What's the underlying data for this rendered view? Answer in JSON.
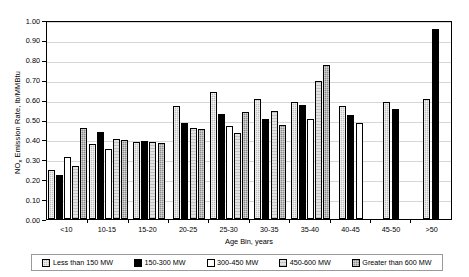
{
  "chart_data": {
    "type": "bar",
    "title": "",
    "xlabel": "Age Bin, years",
    "ylabel": "NOx Emission Rate, lb/MMBtu",
    "ylim": [
      0.0,
      1.0
    ],
    "ytick_step": 0.1,
    "grid": true,
    "legend_position": "bottom",
    "categories": [
      "<10",
      "10-15",
      "15-20",
      "20-25",
      "25-30",
      "30-35",
      "35-40",
      "40-45",
      "45-50",
      ">50"
    ],
    "ytick_labels": [
      "0.00",
      "0.10",
      "0.20",
      "0.30",
      "0.40",
      "0.50",
      "0.60",
      "0.70",
      "0.80",
      "0.90",
      "1.00"
    ],
    "series": [
      {
        "name": "Less than 150 MW",
        "color": "#bfbfbf",
        "values": [
          0.245,
          0.375,
          0.385,
          0.567,
          0.637,
          0.603,
          0.588,
          0.568,
          0.587,
          0.605
        ]
      },
      {
        "name": "150-300 MW",
        "color": "#000000",
        "values": [
          0.222,
          0.438,
          0.392,
          0.485,
          0.528,
          0.502,
          0.575,
          0.522,
          0.555,
          0.955
        ]
      },
      {
        "name": "300-450 MW",
        "color": "#ffffff",
        "values": [
          0.313,
          0.352,
          null,
          null,
          0.467,
          null,
          0.502,
          0.483,
          null,
          null
        ]
      },
      {
        "name": "450-600 MW",
        "color": "#e2e2e2",
        "values": [
          0.265,
          0.402,
          0.388,
          0.458,
          0.433,
          0.545,
          0.695,
          null,
          null,
          null
        ]
      },
      {
        "name": "Greater than 600 MW",
        "color": "#8c8c8c",
        "values": [
          0.455,
          0.395,
          0.382,
          0.453,
          0.54,
          0.47,
          0.775,
          null,
          null,
          null
        ]
      }
    ]
  },
  "legend": {
    "items": [
      {
        "label": "Less than 150 MW"
      },
      {
        "label": "150-300 MW"
      },
      {
        "label": "300-450 MW"
      },
      {
        "label": "450-600 MW"
      },
      {
        "label": "Greater than 600 MW"
      }
    ]
  },
  "axis": {
    "y_title_main": "Emission Rate, lb/MMBtu",
    "y_title_prefix": "NO",
    "y_title_sub": "x"
  }
}
